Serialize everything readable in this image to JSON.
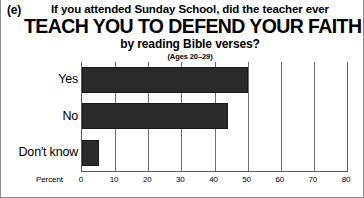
{
  "panel": {
    "letter": "(e)"
  },
  "title": {
    "line1": "If you attended Sunday School, did the teacher ever",
    "line2": "TEACH YOU TO DEFEND YOUR FAITH",
    "line3": "by reading Bible verses?",
    "subtitle": "(Ages 20–29)"
  },
  "axis": {
    "name": "Percent"
  },
  "colors": {
    "bar": "#2b2b2b",
    "grid": "#6f6f6f",
    "axis": "#5d5d5d",
    "text": "#000000",
    "background": "#ffffff"
  },
  "chart_data": {
    "type": "bar",
    "orientation": "horizontal",
    "title": "TEACH YOU TO DEFEND YOUR FAITH",
    "subtitle": "(Ages 20–29)",
    "question": "If you attended Sunday School, did the teacher ever TEACH YOU TO DEFEND YOUR FAITH by reading Bible verses?",
    "categories": [
      "Yes",
      "No",
      "Don't know"
    ],
    "values": [
      50,
      44,
      5
    ],
    "xlabel": "Percent",
    "ylabel": "",
    "xlim": [
      0,
      80
    ],
    "xticks": [
      0,
      10,
      20,
      30,
      40,
      50,
      60,
      70,
      80
    ],
    "xtick_labels": [
      "0",
      "10",
      "20",
      "30",
      "40",
      "50",
      "60",
      "70",
      "80"
    ],
    "grid": true,
    "grid_axis": "x",
    "legend": false
  }
}
